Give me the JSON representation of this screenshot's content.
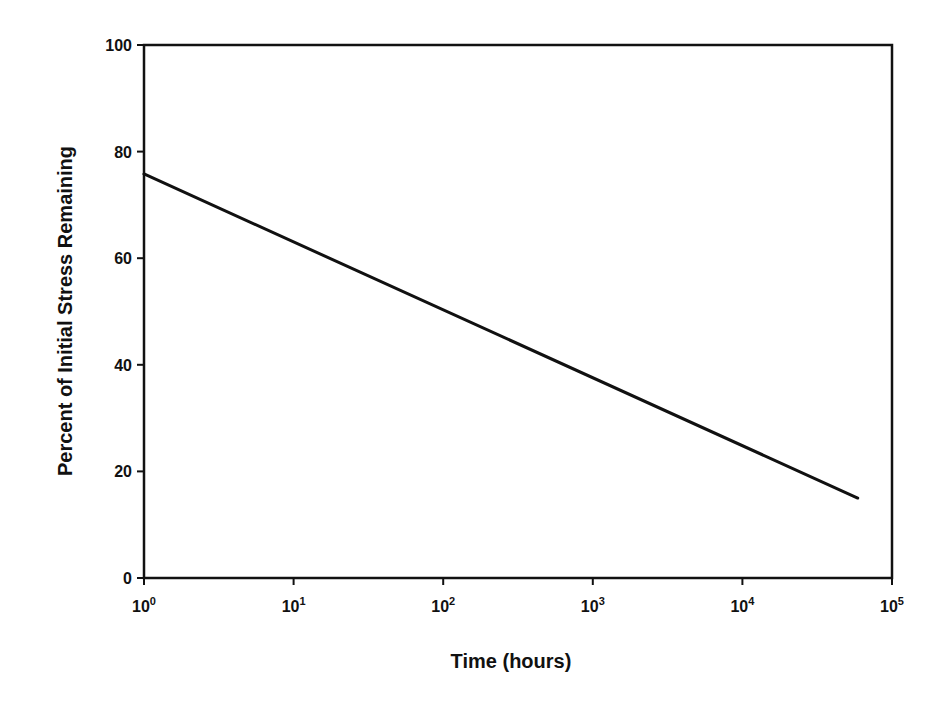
{
  "chart_data": {
    "type": "line",
    "title": "",
    "xlabel": "Time (hours)",
    "ylabel": "Percent of Initial Stress Remaining",
    "xscale": "log",
    "xlim": [
      1,
      100000
    ],
    "ylim": [
      0,
      100
    ],
    "x_ticks": [
      {
        "base": "10",
        "exp": "0",
        "value": 1
      },
      {
        "base": "10",
        "exp": "1",
        "value": 10
      },
      {
        "base": "10",
        "exp": "2",
        "value": 100
      },
      {
        "base": "10",
        "exp": "3",
        "value": 1000
      },
      {
        "base": "10",
        "exp": "4",
        "value": 10000
      },
      {
        "base": "10",
        "exp": "5",
        "value": 100000
      }
    ],
    "y_ticks": [
      "0",
      "20",
      "40",
      "60",
      "80",
      "100"
    ],
    "grid": false,
    "legend": null,
    "series": [
      {
        "name": "Stress relaxation",
        "color": "#111111",
        "x": [
          1,
          59000
        ],
        "y": [
          75.8,
          15.0
        ]
      }
    ]
  }
}
